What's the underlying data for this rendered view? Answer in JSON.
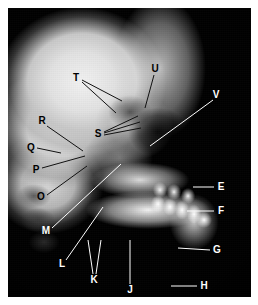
{
  "figure": {
    "type": "lateral-cephalometric-radiograph",
    "background_color": "#ffffff",
    "plate": {
      "x": 8,
      "y": 8,
      "width": 243,
      "height": 289
    }
  },
  "labels": [
    {
      "id": "T",
      "text": "T",
      "x": 76,
      "y": 78,
      "color": "dark",
      "lines": [
        [
          82,
          80,
          122,
          101
        ],
        [
          82,
          82,
          116,
          113
        ]
      ]
    },
    {
      "id": "U",
      "text": "U",
      "x": 155,
      "y": 69,
      "color": "dark",
      "lines": [
        [
          154,
          75,
          145,
          108
        ]
      ]
    },
    {
      "id": "V",
      "text": "V",
      "x": 216,
      "y": 95,
      "color": "light",
      "lines": [
        [
          213,
          100,
          150,
          146
        ]
      ]
    },
    {
      "id": "R",
      "text": "R",
      "x": 42,
      "y": 121,
      "color": "dark",
      "lines": [
        [
          47,
          126,
          83,
          151
        ]
      ]
    },
    {
      "id": "S",
      "text": "S",
      "x": 98,
      "y": 134,
      "color": "dark",
      "lines": [
        [
          104,
          132,
          138,
          116
        ],
        [
          104,
          133,
          140,
          122
        ],
        [
          104,
          135,
          141,
          128
        ]
      ]
    },
    {
      "id": "Q",
      "text": "Q",
      "x": 31,
      "y": 148,
      "color": "dark",
      "lines": [
        [
          37,
          148,
          61,
          153
        ]
      ]
    },
    {
      "id": "P",
      "text": "P",
      "x": 36,
      "y": 170,
      "color": "dark",
      "lines": [
        [
          42,
          168,
          85,
          156
        ]
      ]
    },
    {
      "id": "O",
      "text": "O",
      "x": 41,
      "y": 197,
      "color": "dark",
      "lines": [
        [
          47,
          195,
          87,
          166
        ]
      ]
    },
    {
      "id": "M",
      "text": "M",
      "x": 46,
      "y": 231,
      "color": "light",
      "lines": [
        [
          52,
          228,
          121,
          164
        ]
      ]
    },
    {
      "id": "L",
      "text": "L",
      "x": 62,
      "y": 264,
      "color": "light",
      "lines": [
        [
          66,
          260,
          103,
          207
        ]
      ]
    },
    {
      "id": "K",
      "text": "K",
      "x": 94,
      "y": 280,
      "color": "light",
      "lines": [
        [
          93,
          274,
          88,
          240
        ],
        [
          96,
          274,
          101,
          240
        ]
      ]
    },
    {
      "id": "J",
      "text": "J",
      "x": 130,
      "y": 290,
      "color": "light",
      "lines": [
        [
          130,
          284,
          130,
          240
        ]
      ]
    },
    {
      "id": "E",
      "text": "E",
      "x": 221,
      "y": 187,
      "color": "light",
      "lines": [
        [
          214,
          187,
          193,
          187
        ]
      ]
    },
    {
      "id": "F",
      "text": "F",
      "x": 221,
      "y": 211,
      "color": "light",
      "lines": [
        [
          214,
          211,
          187,
          211
        ]
      ]
    },
    {
      "id": "G",
      "text": "G",
      "x": 217,
      "y": 250,
      "color": "light",
      "lines": [
        [
          210,
          250,
          178,
          248
        ]
      ]
    },
    {
      "id": "H",
      "text": "H",
      "x": 204,
      "y": 286,
      "color": "light",
      "lines": [
        [
          197,
          286,
          171,
          286
        ]
      ]
    }
  ],
  "line_style": {
    "color": "#ffffff",
    "dark_color": "#111111",
    "width": 1
  }
}
